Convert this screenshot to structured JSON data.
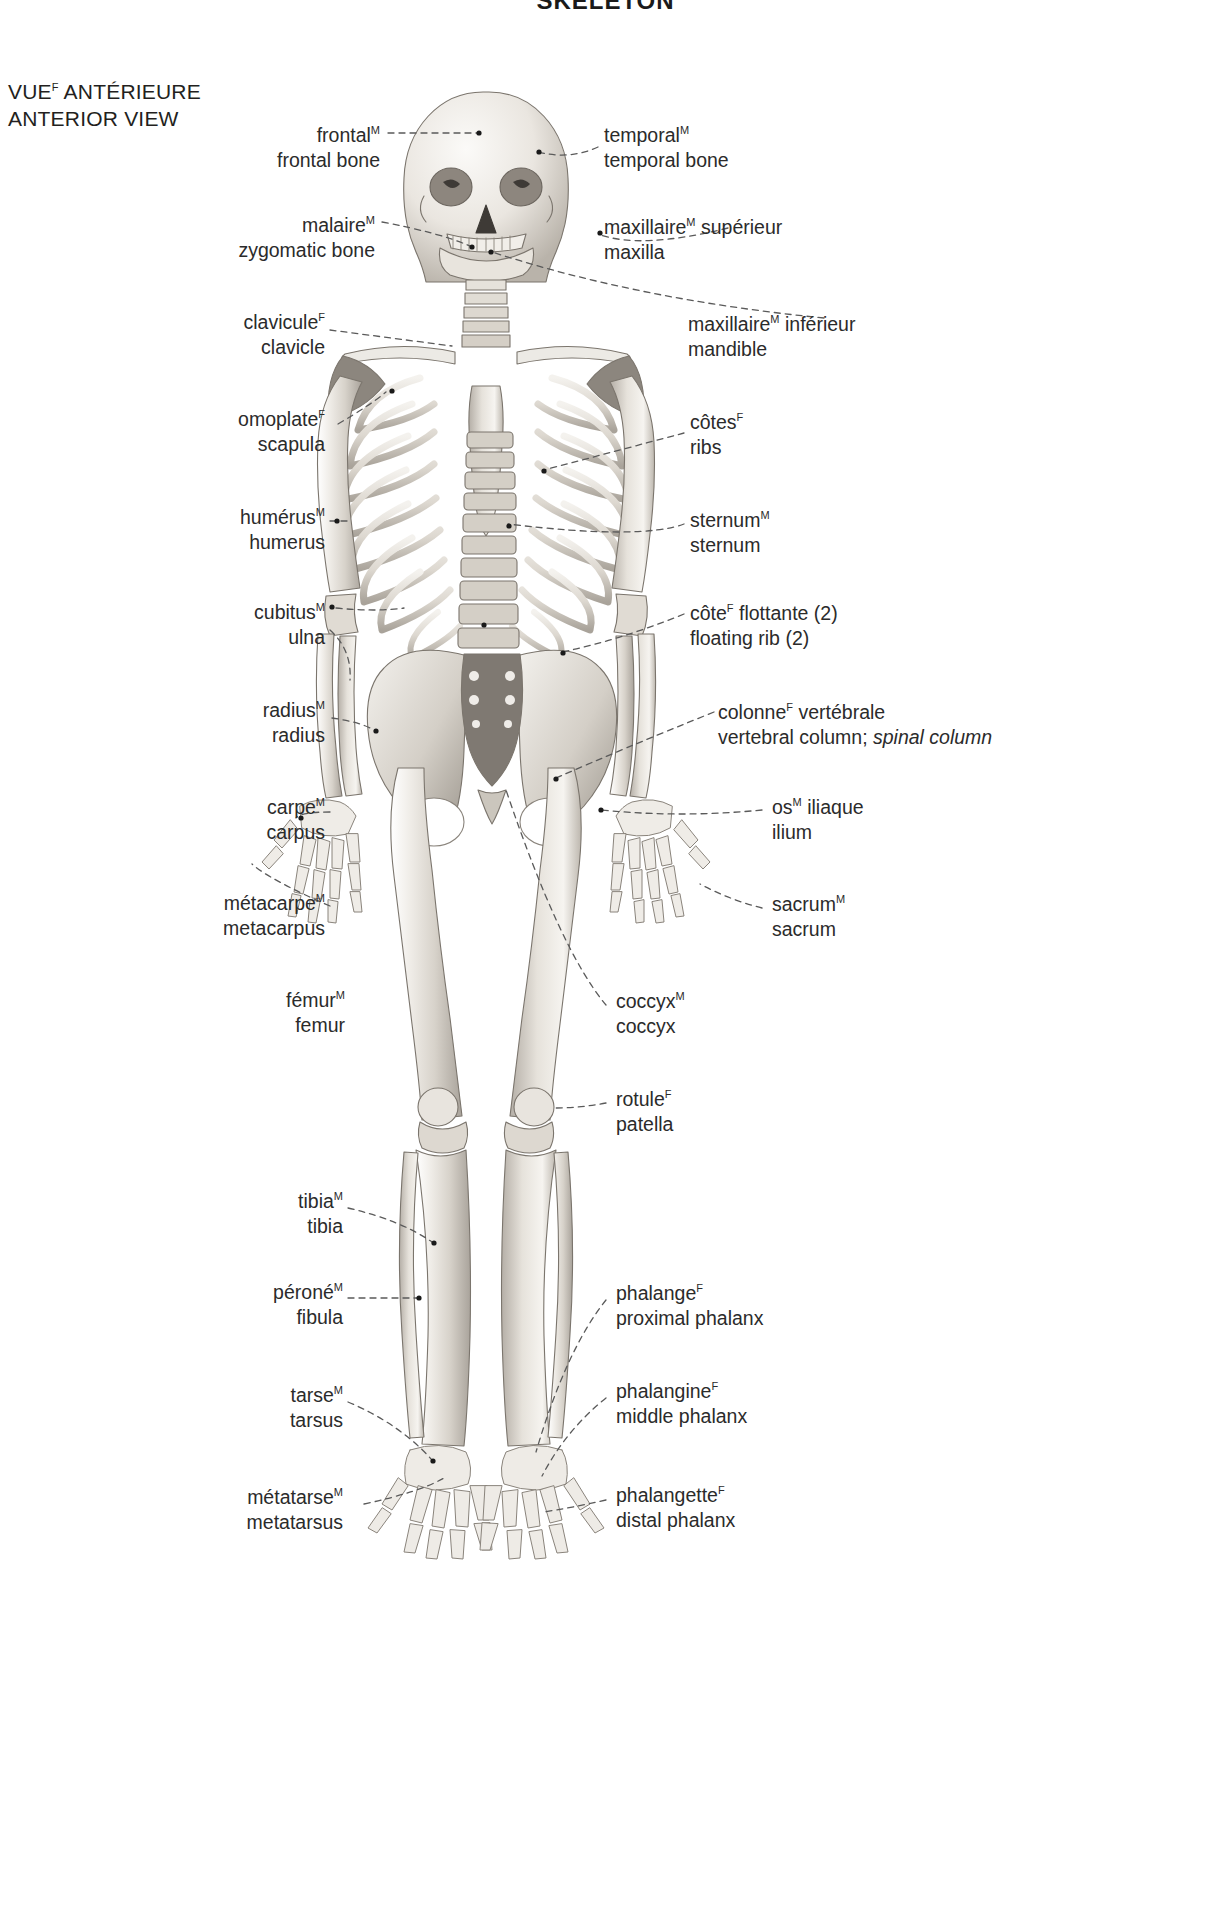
{
  "plate": {
    "title": "SKELETON",
    "view_fr": "VUE",
    "view_fr_gender": "F",
    "view_fr_rest": " ANTÉRIEURE",
    "view_en": "ANTERIOR VIEW"
  },
  "labels": [
    {
      "id": "frontal",
      "side": "left",
      "fr": "frontal",
      "fr_gender": "M",
      "fr_rest": "",
      "en": "frontal bone",
      "en_italic": ""
    },
    {
      "id": "temporal",
      "side": "right",
      "fr": "temporal",
      "fr_gender": "M",
      "fr_rest": "",
      "en": "temporal bone",
      "en_italic": ""
    },
    {
      "id": "zygomatic",
      "side": "left",
      "fr": "malaire",
      "fr_gender": "M",
      "fr_rest": "",
      "en": "zygomatic bone",
      "en_italic": ""
    },
    {
      "id": "maxilla",
      "side": "right",
      "fr": "maxillaire",
      "fr_gender": "M",
      "fr_rest": " supérieur",
      "en": "maxilla",
      "en_italic": ""
    },
    {
      "id": "mandible",
      "side": "right",
      "fr": "maxillaire",
      "fr_gender": "M",
      "fr_rest": " inférieur",
      "en": "mandible",
      "en_italic": ""
    },
    {
      "id": "clavicle",
      "side": "left",
      "fr": "clavicule",
      "fr_gender": "F",
      "fr_rest": "",
      "en": "clavicle",
      "en_italic": ""
    },
    {
      "id": "scapula",
      "side": "left",
      "fr": "omoplate",
      "fr_gender": "F",
      "fr_rest": "",
      "en": "scapula",
      "en_italic": ""
    },
    {
      "id": "humerus",
      "side": "left",
      "fr": "humérus",
      "fr_gender": "M",
      "fr_rest": "",
      "en": "humerus",
      "en_italic": ""
    },
    {
      "id": "ribs",
      "side": "right",
      "fr": "côtes",
      "fr_gender": "F",
      "fr_rest": "",
      "en": "ribs",
      "en_italic": ""
    },
    {
      "id": "sternum",
      "side": "right",
      "fr": "sternum",
      "fr_gender": "M",
      "fr_rest": "",
      "en": "sternum",
      "en_italic": ""
    },
    {
      "id": "ulna",
      "side": "left",
      "fr": "cubitus",
      "fr_gender": "M",
      "fr_rest": "",
      "en": "ulna",
      "en_italic": ""
    },
    {
      "id": "floating-rib",
      "side": "right",
      "fr": "côte",
      "fr_gender": "F",
      "fr_rest": " flottante (2)",
      "en": "floating rib (2)",
      "en_italic": ""
    },
    {
      "id": "radius",
      "side": "left",
      "fr": "radius",
      "fr_gender": "M",
      "fr_rest": "",
      "en": "radius",
      "en_italic": ""
    },
    {
      "id": "vertebral-column",
      "side": "right",
      "fr": "colonne",
      "fr_gender": "F",
      "fr_rest": " vertébrale",
      "en": "vertebral column; ",
      "en_italic": "spinal column"
    },
    {
      "id": "carpus",
      "side": "left",
      "fr": "carpe",
      "fr_gender": "M",
      "fr_rest": "",
      "en": "carpus",
      "en_italic": ""
    },
    {
      "id": "ilium",
      "side": "right",
      "fr": "os",
      "fr_gender": "M",
      "fr_rest": " iliaque",
      "en": "ilium",
      "en_italic": ""
    },
    {
      "id": "metacarpus",
      "side": "left",
      "fr": "métacarpe",
      "fr_gender": "M",
      "fr_rest": "",
      "en": "metacarpus",
      "en_italic": ""
    },
    {
      "id": "sacrum",
      "side": "right",
      "fr": "sacrum",
      "fr_gender": "M",
      "fr_rest": "",
      "en": "sacrum",
      "en_italic": ""
    },
    {
      "id": "femur",
      "side": "left",
      "fr": "fémur",
      "fr_gender": "M",
      "fr_rest": "",
      "en": "femur",
      "en_italic": ""
    },
    {
      "id": "coccyx",
      "side": "right",
      "fr": "coccyx",
      "fr_gender": "M",
      "fr_rest": "",
      "en": "coccyx",
      "en_italic": ""
    },
    {
      "id": "patella",
      "side": "right",
      "fr": "rotule",
      "fr_gender": "F",
      "fr_rest": "",
      "en": "patella",
      "en_italic": ""
    },
    {
      "id": "tibia",
      "side": "left",
      "fr": "tibia",
      "fr_gender": "M",
      "fr_rest": "",
      "en": "tibia",
      "en_italic": ""
    },
    {
      "id": "fibula",
      "side": "left",
      "fr": "péroné",
      "fr_gender": "M",
      "fr_rest": "",
      "en": "fibula",
      "en_italic": ""
    },
    {
      "id": "proximal-phalanx",
      "side": "right",
      "fr": "phalange",
      "fr_gender": "F",
      "fr_rest": "",
      "en": "proximal phalanx",
      "en_italic": ""
    },
    {
      "id": "tarsus",
      "side": "left",
      "fr": "tarse",
      "fr_gender": "M",
      "fr_rest": "",
      "en": "tarsus",
      "en_italic": ""
    },
    {
      "id": "middle-phalanx",
      "side": "right",
      "fr": "phalangine",
      "fr_gender": "F",
      "fr_rest": "",
      "en": "middle phalanx",
      "en_italic": ""
    },
    {
      "id": "metatarsus",
      "side": "left",
      "fr": "métatarse",
      "fr_gender": "M",
      "fr_rest": "",
      "en": "metatarsus",
      "en_italic": ""
    },
    {
      "id": "distal-phalanx",
      "side": "right",
      "fr": "phalangette",
      "fr_gender": "F",
      "fr_rest": "",
      "en": "distal phalanx",
      "en_italic": ""
    }
  ],
  "colors": {
    "text": "#2b2b2b",
    "leader": "#5a5a5a",
    "bone_light": "#f2f0ec",
    "bone_mid": "#cfcac2",
    "bone_dark": "#9a948c",
    "bone_shadow": "#6f6a64",
    "background": "#ffffff"
  }
}
